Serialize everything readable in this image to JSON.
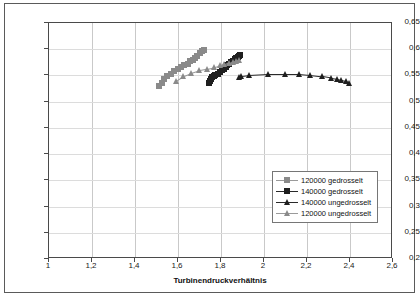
{
  "chart_data": {
    "type": "scatter",
    "title": "",
    "xlabel": "Turbinendruckverhältnis",
    "ylabel": "Turbinenwirkungsgrad",
    "xlim": [
      1,
      2.6
    ],
    "ylim": [
      0.2,
      0.65
    ],
    "xticks": [
      "1",
      "1,2",
      "1,4",
      "1,6",
      "1,8",
      "2",
      "2,2",
      "2,4",
      "2,6"
    ],
    "xtick_values": [
      1,
      1.2,
      1.4,
      1.6,
      1.8,
      2.0,
      2.2,
      2.4,
      2.6
    ],
    "yticks": [
      "0,2",
      "0,25",
      "0,3",
      "0,35",
      "0,4",
      "0,45",
      "0,5",
      "0,55",
      "0,6",
      "0,65"
    ],
    "ytick_values": [
      0.2,
      0.25,
      0.3,
      0.35,
      0.4,
      0.45,
      0.5,
      0.55,
      0.6,
      0.65
    ],
    "grid": "both",
    "legend_position": "center-right",
    "series": [
      {
        "name": "120000 gedrosselt",
        "marker": "square",
        "color": "#8a8a8a",
        "line_color": "#9a9a9a",
        "points": [
          [
            1.512,
            0.529
          ],
          [
            1.524,
            0.536
          ],
          [
            1.537,
            0.543
          ],
          [
            1.551,
            0.548
          ],
          [
            1.566,
            0.552
          ],
          [
            1.582,
            0.558
          ],
          [
            1.598,
            0.562
          ],
          [
            1.613,
            0.566
          ],
          [
            1.629,
            0.57
          ],
          [
            1.645,
            0.572
          ],
          [
            1.658,
            0.577
          ],
          [
            1.668,
            0.58
          ],
          [
            1.679,
            0.584
          ],
          [
            1.69,
            0.588
          ],
          [
            1.7,
            0.592
          ],
          [
            1.711,
            0.596
          ],
          [
            1.719,
            0.598
          ]
        ]
      },
      {
        "name": "140000 gedrosselt",
        "marker": "square",
        "color": "#1f1f1f",
        "line_color": "#2a2a2a",
        "points": [
          [
            1.742,
            0.535
          ],
          [
            1.748,
            0.539
          ],
          [
            1.754,
            0.543
          ],
          [
            1.76,
            0.547
          ],
          [
            1.766,
            0.549
          ],
          [
            1.774,
            0.551
          ],
          [
            1.784,
            0.553
          ],
          [
            1.794,
            0.557
          ],
          [
            1.803,
            0.56
          ],
          [
            1.812,
            0.563
          ],
          [
            1.821,
            0.566
          ],
          [
            1.83,
            0.569
          ],
          [
            1.839,
            0.572
          ],
          [
            1.848,
            0.575
          ],
          [
            1.856,
            0.578
          ],
          [
            1.864,
            0.581
          ],
          [
            1.871,
            0.584
          ],
          [
            1.878,
            0.586
          ],
          [
            1.884,
            0.588
          ],
          [
            1.888,
            0.589
          ]
        ]
      },
      {
        "name": "140000 ungedrosselt",
        "marker": "triangle",
        "color": "#1f1f1f",
        "line_color": "#2a2a2a",
        "points": [
          [
            1.884,
            0.547
          ],
          [
            1.896,
            0.549
          ],
          [
            1.932,
            0.551
          ],
          [
            2.02,
            0.553
          ],
          [
            2.102,
            0.553
          ],
          [
            2.164,
            0.553
          ],
          [
            2.214,
            0.551
          ],
          [
            2.274,
            0.548
          ],
          [
            2.314,
            0.545
          ],
          [
            2.34,
            0.543
          ],
          [
            2.362,
            0.541
          ],
          [
            2.382,
            0.539
          ],
          [
            2.398,
            0.536
          ]
        ]
      },
      {
        "name": "120000 ungedrosselt",
        "marker": "triangle",
        "color": "#8a8a8a",
        "line_color": "#9a9a9a",
        "points": [
          [
            1.592,
            0.54
          ],
          [
            1.626,
            0.549
          ],
          [
            1.662,
            0.555
          ],
          [
            1.7,
            0.56
          ],
          [
            1.736,
            0.563
          ],
          [
            1.77,
            0.566
          ],
          [
            1.796,
            0.569
          ],
          [
            1.818,
            0.571
          ],
          [
            1.838,
            0.574
          ],
          [
            1.856,
            0.576
          ],
          [
            1.872,
            0.578
          ],
          [
            1.884,
            0.58
          ]
        ]
      }
    ]
  },
  "legend": {
    "items": [
      {
        "label": "120000 gedrosselt"
      },
      {
        "label": "140000 gedrosselt"
      },
      {
        "label": "140000 ungedrosselt"
      },
      {
        "label": "120000 ungedrosselt"
      }
    ]
  }
}
